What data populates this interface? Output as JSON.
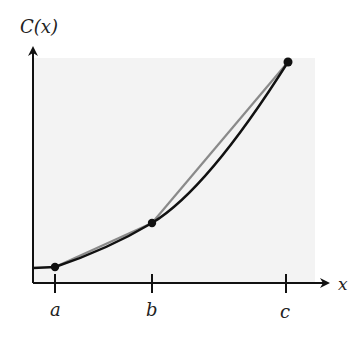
{
  "diagram": {
    "y_axis_label": "C(x)",
    "x_axis_label": "x",
    "tick_labels": [
      "a",
      "b",
      "c"
    ],
    "curve": "convex increasing cost function C(x), flat near origin then rising",
    "secant_lines": [
      {
        "from": "a",
        "to": "b"
      },
      {
        "from": "b",
        "to": "c"
      }
    ],
    "points": [
      "(a, C(a))",
      "(b, C(b))",
      "(c, C(c))"
    ],
    "colors": {
      "curve": "#111111",
      "secant": "#8a8a8a",
      "background_panel": "#f3f3f3",
      "axis": "#111111"
    }
  }
}
